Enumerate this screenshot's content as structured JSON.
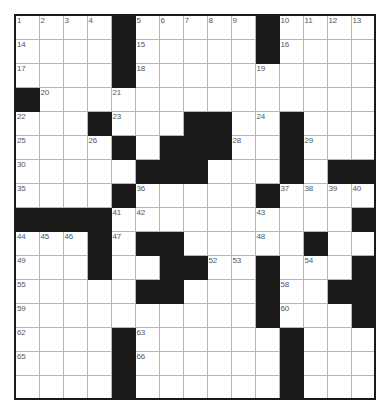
{
  "puzzle": {
    "name": "crossword-grid",
    "columns": 15,
    "rows": 16,
    "cell_size_px": 24,
    "colors": {
      "block_fill": "#1a1a1a",
      "cell_fill": "#ffffff",
      "grid_line": "#b5b5b5",
      "outer_border": "#1a1a1a",
      "number_text": "#555555"
    },
    "legend": {
      "block_token": "#",
      "open_token": "."
    },
    "grid": [
      "....#.....#....",
      "....#.....#....",
      "....#..........",
      "#...............",
      "...#...##..#...",
      "....#.###..#...",
      ".....###...#.##",
      "....#.....#....",
      "####..........#",
      "...#.##.....#..",
      "...#..##..#...#",
      ".....##...#..##",
      "..........#...#",
      "....#......#...",
      "....#......#..."
    ],
    "numbers": [
      {
        "n": 1,
        "row": 1,
        "col": 1
      },
      {
        "n": 2,
        "row": 1,
        "col": 2
      },
      {
        "n": 3,
        "row": 1,
        "col": 3
      },
      {
        "n": 4,
        "row": 1,
        "col": 4
      },
      {
        "n": 5,
        "row": 1,
        "col": 6
      },
      {
        "n": 6,
        "row": 1,
        "col": 7
      },
      {
        "n": 7,
        "row": 1,
        "col": 8
      },
      {
        "n": 8,
        "row": 1,
        "col": 9
      },
      {
        "n": 9,
        "row": 1,
        "col": 10
      },
      {
        "n": 10,
        "row": 1,
        "col": 12
      },
      {
        "n": 11,
        "row": 1,
        "col": 13
      },
      {
        "n": 12,
        "row": 1,
        "col": 14
      },
      {
        "n": 13,
        "row": 1,
        "col": 15
      },
      {
        "n": 14,
        "row": 2,
        "col": 1
      },
      {
        "n": 15,
        "row": 2,
        "col": 6
      },
      {
        "n": 16,
        "row": 2,
        "col": 12
      },
      {
        "n": 17,
        "row": 3,
        "col": 1
      },
      {
        "n": 18,
        "row": 3,
        "col": 6
      },
      {
        "n": 19,
        "row": 3,
        "col": 11
      },
      {
        "n": 20,
        "row": 4,
        "col": 2
      },
      {
        "n": 21,
        "row": 4,
        "col": 5
      },
      {
        "n": 22,
        "row": 5,
        "col": 1
      },
      {
        "n": 23,
        "row": 5,
        "col": 5
      },
      {
        "n": 24,
        "row": 5,
        "col": 11
      },
      {
        "n": 25,
        "row": 6,
        "col": 1
      },
      {
        "n": 26,
        "row": 6,
        "col": 4
      },
      {
        "n": 27,
        "row": 6,
        "col": 9
      },
      {
        "n": 28,
        "row": 6,
        "col": 10
      },
      {
        "n": 29,
        "row": 6,
        "col": 13
      },
      {
        "n": 30,
        "row": 7,
        "col": 1
      },
      {
        "n": 31,
        "row": 7,
        "col": 6
      },
      {
        "n": 32,
        "row": 7,
        "col": 7
      },
      {
        "n": 33,
        "row": 7,
        "col": 8
      },
      {
        "n": 34,
        "row": 7,
        "col": 12
      },
      {
        "n": 35,
        "row": 8,
        "col": 1
      },
      {
        "n": 36,
        "row": 8,
        "col": 6
      },
      {
        "n": 37,
        "row": 8,
        "col": 12
      },
      {
        "n": 38,
        "row": 8,
        "col": 13
      },
      {
        "n": 39,
        "row": 8,
        "col": 14
      },
      {
        "n": 40,
        "row": 8,
        "col": 15
      },
      {
        "n": 41,
        "row": 9,
        "col": 5
      },
      {
        "n": 42,
        "row": 9,
        "col": 6
      },
      {
        "n": 43,
        "row": 9,
        "col": 11
      },
      {
        "n": 44,
        "row": 10,
        "col": 1
      },
      {
        "n": 45,
        "row": 10,
        "col": 2
      },
      {
        "n": 46,
        "row": 10,
        "col": 3
      },
      {
        "n": 47,
        "row": 10,
        "col": 5
      },
      {
        "n": 48,
        "row": 10,
        "col": 11
      },
      {
        "n": 49,
        "row": 11,
        "col": 1
      },
      {
        "n": 50,
        "row": 11,
        "col": 4
      },
      {
        "n": 51,
        "row": 11,
        "col": 8
      },
      {
        "n": 52,
        "row": 11,
        "col": 9
      },
      {
        "n": 53,
        "row": 11,
        "col": 10
      },
      {
        "n": 54,
        "row": 11,
        "col": 13
      },
      {
        "n": 55,
        "row": 12,
        "col": 1
      },
      {
        "n": 56,
        "row": 12,
        "col": 6
      },
      {
        "n": 57,
        "row": 12,
        "col": 7
      },
      {
        "n": 58,
        "row": 12,
        "col": 12
      },
      {
        "n": 59,
        "row": 13,
        "col": 1
      },
      {
        "n": 60,
        "row": 13,
        "col": 12
      },
      {
        "n": 61,
        "row": 13,
        "col": 15
      },
      {
        "n": 62,
        "row": 14,
        "col": 1
      },
      {
        "n": 63,
        "row": 14,
        "col": 6
      },
      {
        "n": 64,
        "row": 14,
        "col": 12
      },
      {
        "n": 65,
        "row": 15,
        "col": 1
      },
      {
        "n": 66,
        "row": 15,
        "col": 6
      },
      {
        "n": 67,
        "row": 15,
        "col": 12
      }
    ],
    "entries": []
  }
}
